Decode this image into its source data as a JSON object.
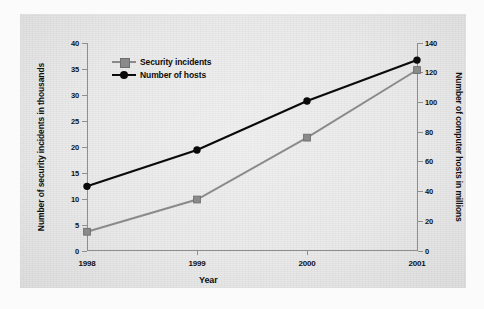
{
  "chart_data": {
    "type": "line",
    "title": "",
    "xlabel": "Year",
    "categories": [
      "1998",
      "1999",
      "2000",
      "2001"
    ],
    "grid": false,
    "legend_position": "top-left",
    "series": [
      {
        "name": "Security incidents",
        "axis": "left",
        "unit": "thousands",
        "color": "#8a8a8a",
        "marker": "square",
        "values": [
          3.7,
          9.9,
          21.8,
          34.8
        ]
      },
      {
        "name": "Number of hosts",
        "axis": "right",
        "unit": "millions",
        "color": "#0a0a0a",
        "marker": "circle",
        "values": [
          43.5,
          68.0,
          101.0,
          128.5
        ]
      }
    ],
    "axes": {
      "left": {
        "label": "Number of security incidents in thousands",
        "ticks": [
          0,
          5,
          10,
          15,
          20,
          25,
          30,
          35,
          40
        ],
        "ylim": [
          0,
          40
        ]
      },
      "right": {
        "label": "Number of computer hosts in millions",
        "ticks": [
          0,
          20,
          40,
          60,
          80,
          100,
          120,
          140
        ],
        "ylim": [
          0,
          140
        ]
      },
      "bottom": {
        "label": "Year",
        "ticks": [
          "1998",
          "1999",
          "2000",
          "2001"
        ]
      }
    }
  },
  "caption": {
    "text": ""
  }
}
